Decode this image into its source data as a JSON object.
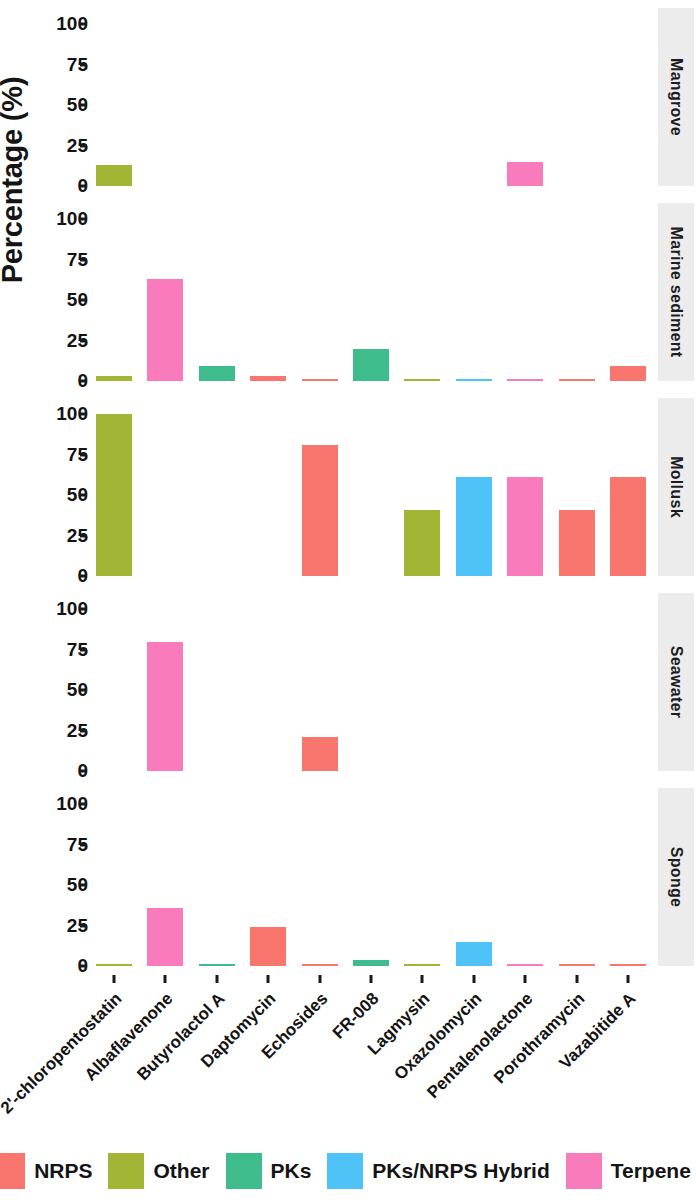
{
  "chart_data": {
    "type": "bar",
    "title": "",
    "subtitle": "",
    "xlabel": "",
    "ylabel": "Percentage (%)",
    "ylim": [
      0,
      110
    ],
    "yticks": [
      0,
      25,
      50,
      75,
      100
    ],
    "ytick_labels": [
      "0",
      "25",
      "50",
      "75",
      "100"
    ],
    "grid": false,
    "legend_position": "bottom",
    "facet_variable": "Source",
    "facet_position": "right",
    "categories": [
      "2'-chloropentostatin",
      "Albaflavenone",
      "Butyrolactol A",
      "Daptomycin",
      "Echosides",
      "FR-008",
      "Lagmysin",
      "Oxazolomycin",
      "Pentalenolactone",
      "Porothramycin",
      "Vazabitide A"
    ],
    "category_classes": [
      "Other",
      "Terpene",
      "PKs",
      "NRPS",
      "NRPS",
      "PKs",
      "Other",
      "PKs/NRPS Hybrid",
      "Terpene",
      "NRPS",
      "NRPS"
    ],
    "legend": [
      {
        "name": "NRPS",
        "color": "#F8766D"
      },
      {
        "name": "Other",
        "color": "#A3B534"
      },
      {
        "name": "PKs",
        "color": "#3FBC8C"
      },
      {
        "name": "PKs/NRPS Hybrid",
        "color": "#4FC3F7"
      },
      {
        "name": "Terpene",
        "color": "#F97BBC"
      }
    ],
    "facets": [
      {
        "label": "Mangrove",
        "values": [
          13,
          0,
          0,
          0,
          0,
          0,
          0,
          0,
          15,
          0,
          0
        ]
      },
      {
        "label": "Marine sediment",
        "values": [
          3,
          63,
          9,
          3,
          1,
          20,
          1,
          1,
          1,
          1,
          9
        ]
      },
      {
        "label": "Mollusk",
        "values": [
          100,
          0,
          0,
          0,
          81,
          0,
          41,
          61,
          61,
          41,
          61
        ]
      },
      {
        "label": "Seawater",
        "values": [
          0,
          80,
          0,
          0,
          21,
          0,
          0,
          0,
          0,
          0,
          0
        ]
      },
      {
        "label": "Sponge",
        "values": [
          1,
          36,
          1,
          24,
          1,
          4,
          1,
          15,
          1,
          1,
          1
        ]
      }
    ]
  }
}
